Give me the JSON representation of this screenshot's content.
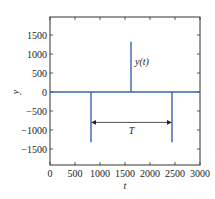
{
  "chart_data": {
    "type": "line",
    "title": "",
    "xlabel": "t",
    "ylabel": "y",
    "xlim": [
      0,
      3000
    ],
    "ylim": [
      -2000,
      2000
    ],
    "xticks": [
      0,
      500,
      1000,
      1500,
      2000,
      2500,
      3000
    ],
    "xtick_labels": [
      "0",
      "500",
      "1000",
      "1500",
      "2000",
      "2500",
      "3000"
    ],
    "yticks": [
      -1500,
      -1000,
      -500,
      0,
      500,
      1000,
      1500
    ],
    "ytick_labels": [
      "−1500",
      "−1000",
      "−500",
      "0",
      "500",
      "1000",
      "1500"
    ],
    "grid": false,
    "series": [
      {
        "name": "y(t)",
        "color": "#3a62b0",
        "description": "baseline at 0 with impulse spikes",
        "spikes": [
          {
            "t": 820,
            "y": -1320
          },
          {
            "t": 1620,
            "y": 1320
          },
          {
            "t": 2440,
            "y": -1320
          }
        ]
      }
    ],
    "annotations": [
      {
        "text": "y(t)",
        "t": 1700,
        "y": 800
      },
      {
        "text": "T",
        "type": "double-arrow",
        "t_start": 820,
        "t_end": 2440,
        "y": -800
      }
    ]
  }
}
